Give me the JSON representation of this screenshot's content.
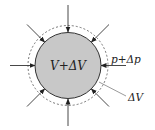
{
  "diagram": {
    "labels": {
      "volume": "V+ΔV",
      "pressure": "p+Δp",
      "delta_volume": "ΔV"
    },
    "shapes": {
      "center": [
        68,
        65.5
      ],
      "solid_radius": 33,
      "dashed_radius": 40,
      "arrow_outer_radius": 60,
      "arrow_count": 8
    },
    "colors": {
      "fill": "#c8c8c8",
      "stroke": "#333333",
      "dashed": "#555555"
    }
  }
}
